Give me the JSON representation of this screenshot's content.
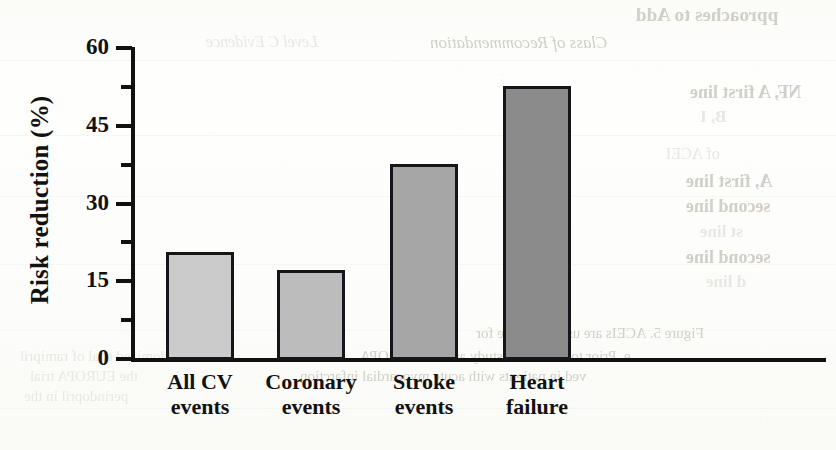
{
  "chart_data": {
    "type": "bar",
    "title": "",
    "subtitle": "",
    "xlabel": "",
    "ylabel": "Risk reduction (%)",
    "categories": [
      "All CV events",
      "Coronary events",
      "Stroke events",
      "Heart failure"
    ],
    "category_lines": [
      [
        "All CV",
        "events"
      ],
      [
        "Coronary",
        "events"
      ],
      [
        "Stroke",
        "events"
      ],
      [
        "Heart",
        "failure"
      ]
    ],
    "values": [
      20.5,
      17,
      37.5,
      52.5
    ],
    "bar_colors": [
      "#cbcbcb",
      "#bcbcbc",
      "#a6a6a6",
      "#8b8b8b"
    ],
    "bar_border_color": "#15151a",
    "ylim": [
      0,
      60
    ],
    "ytick_major": [
      0,
      15,
      30,
      45,
      60
    ],
    "ytick_minor": [
      7.5,
      22.5,
      37.5,
      52.5
    ],
    "ytick_labels": [
      "0",
      "15",
      "30",
      "45",
      "60"
    ],
    "grid": false,
    "legend": null,
    "legend_position": "none",
    "axis_color": "#111111",
    "background_color": "#fdfdfb"
  },
  "bleed_through": {
    "note": "faint mirrored text showing through from the reverse side of the scanned page",
    "items": [
      {
        "text": "pproaches to Add",
        "x": 636,
        "y": 4,
        "size": 19,
        "weight": "bold",
        "style": "normal",
        "tone": "strong"
      },
      {
        "text": "Class of Recommendation",
        "x": 430,
        "y": 33,
        "size": 17,
        "weight": "normal",
        "style": "italic",
        "tone": "strong"
      },
      {
        "text": "Level C Evidence",
        "x": 206,
        "y": 33,
        "size": 16,
        "weight": "normal",
        "style": "italic",
        "tone": "faint"
      },
      {
        "text": "NF, A first line",
        "x": 690,
        "y": 82,
        "size": 18,
        "weight": "bold",
        "style": "normal",
        "tone": "strong"
      },
      {
        "text": "B, I",
        "x": 700,
        "y": 107,
        "size": 17,
        "weight": "bold",
        "style": "normal",
        "tone": "faint"
      },
      {
        "text": "C",
        "x": 560,
        "y": 84,
        "size": 15,
        "weight": "normal",
        "style": "normal",
        "tone": "faint"
      },
      {
        "text": "B",
        "x": 560,
        "y": 110,
        "size": 15,
        "weight": "normal",
        "style": "normal",
        "tone": "faint"
      },
      {
        "text": "of ACEI",
        "x": 666,
        "y": 145,
        "size": 16,
        "weight": "normal",
        "style": "normal",
        "tone": "faint"
      },
      {
        "text": "A, first line",
        "x": 686,
        "y": 171,
        "size": 18,
        "weight": "bold",
        "style": "normal",
        "tone": "strong"
      },
      {
        "text": "second line",
        "x": 686,
        "y": 196,
        "size": 18,
        "weight": "bold",
        "style": "normal",
        "tone": "strong"
      },
      {
        "text": "C",
        "x": 560,
        "y": 148,
        "size": 15,
        "weight": "normal",
        "style": "normal",
        "tone": "faint"
      },
      {
        "text": "B",
        "x": 560,
        "y": 174,
        "size": 15,
        "weight": "normal",
        "style": "normal",
        "tone": "faint"
      },
      {
        "text": "st line",
        "x": 700,
        "y": 222,
        "size": 17,
        "weight": "bold",
        "style": "normal",
        "tone": "faint"
      },
      {
        "text": "second line",
        "x": 686,
        "y": 247,
        "size": 18,
        "weight": "bold",
        "style": "normal",
        "tone": "strong"
      },
      {
        "text": "d line",
        "x": 706,
        "y": 272,
        "size": 17,
        "weight": "bold",
        "style": "normal",
        "tone": "faint"
      },
      {
        "text": "B",
        "x": 560,
        "y": 224,
        "size": 15,
        "weight": "normal",
        "style": "normal",
        "tone": "faint"
      },
      {
        "text": "B",
        "x": 560,
        "y": 250,
        "size": 15,
        "weight": "normal",
        "style": "normal",
        "tone": "faint"
      },
      {
        "text": "Figure 5. ACEIs are used first-line for",
        "x": 476,
        "y": 325,
        "size": 15,
        "weight": "normal",
        "style": "normal",
        "tone": "strong"
      },
      {
        "text": "e. Prior to the HOPE study and the EUROPA",
        "x": 360,
        "y": 348,
        "size": 15,
        "weight": "normal",
        "style": "normal",
        "tone": "strong"
      },
      {
        "text": "ved in patients with acute myocardial infarction",
        "x": 300,
        "y": 368,
        "size": 15,
        "weight": "normal",
        "style": "normal",
        "tone": "strong"
      },
      {
        "text": "d in a randomized trial of ramipril",
        "x": 20,
        "y": 348,
        "size": 15,
        "weight": "normal",
        "style": "normal",
        "tone": "faint"
      },
      {
        "text": "the EUROPA trial",
        "x": 30,
        "y": 368,
        "size": 15,
        "weight": "normal",
        "style": "normal",
        "tone": "faint"
      },
      {
        "text": "perindopril in the",
        "x": 24,
        "y": 388,
        "size": 15,
        "weight": "normal",
        "style": "normal",
        "tone": "faint"
      }
    ]
  },
  "layout": {
    "plot_left": 131,
    "plot_baseline": 358,
    "plot_top": 47,
    "plot_right": 826,
    "bars": [
      {
        "x": 166,
        "width": 68
      },
      {
        "x": 277,
        "width": 68
      },
      {
        "x": 390,
        "width": 68
      },
      {
        "x": 503,
        "width": 68
      }
    ]
  }
}
